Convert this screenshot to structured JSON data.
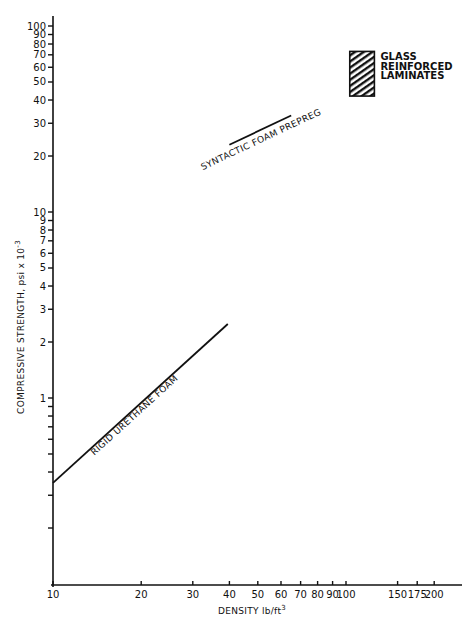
{
  "chart_data": {
    "type": "line",
    "title": "",
    "xlabel": "DENSITY lb/ft",
    "xlabel_superscript": "3",
    "ylabel": "COMPRESSIVE STRENGTH, psi x 10",
    "ylabel_superscript": "-3",
    "xscale": "log",
    "yscale": "log",
    "xlim": [
      10,
      260
    ],
    "ylim": [
      0.1,
      110
    ],
    "grid": false,
    "x_ticks": [
      {
        "value": 10,
        "label": "10"
      },
      {
        "value": 20,
        "label": "20"
      },
      {
        "value": 30,
        "label": "30"
      },
      {
        "value": 40,
        "label": "40"
      },
      {
        "value": 50,
        "label": "50"
      },
      {
        "value": 60,
        "label": "60"
      },
      {
        "value": 70,
        "label": "70"
      },
      {
        "value": 80,
        "label": "80"
      },
      {
        "value": 90,
        "label": "90"
      },
      {
        "value": 100,
        "label": "100"
      },
      {
        "value": 150,
        "label": "150"
      },
      {
        "value": 175,
        "label": "175"
      },
      {
        "value": 200,
        "label": "200"
      }
    ],
    "y_ticks": [
      {
        "value": 0.2,
        "label": ""
      },
      {
        "value": 0.3,
        "label": ""
      },
      {
        "value": 0.4,
        "label": ""
      },
      {
        "value": 0.5,
        "label": ""
      },
      {
        "value": 0.6,
        "label": ""
      },
      {
        "value": 0.7,
        "label": ""
      },
      {
        "value": 0.8,
        "label": ""
      },
      {
        "value": 0.9,
        "label": ""
      },
      {
        "value": 1,
        "label": "1"
      },
      {
        "value": 2,
        "label": "2"
      },
      {
        "value": 3,
        "label": "3"
      },
      {
        "value": 4,
        "label": "4"
      },
      {
        "value": 5,
        "label": "5"
      },
      {
        "value": 6,
        "label": "6"
      },
      {
        "value": 7,
        "label": "7"
      },
      {
        "value": 8,
        "label": "8"
      },
      {
        "value": 9,
        "label": "9"
      },
      {
        "value": 10,
        "label": "10"
      },
      {
        "value": 20,
        "label": "20"
      },
      {
        "value": 30,
        "label": "30"
      },
      {
        "value": 40,
        "label": "40"
      },
      {
        "value": 50,
        "label": "50"
      },
      {
        "value": 60,
        "label": "60"
      },
      {
        "value": 70,
        "label": "70"
      },
      {
        "value": 80,
        "label": "80"
      },
      {
        "value": 90,
        "label": "90"
      },
      {
        "value": 100,
        "label": "100"
      }
    ],
    "series": [
      {
        "name": "RIGID URETHANE FOAM",
        "x": [
          10,
          39.5
        ],
        "y": [
          0.35,
          2.5
        ]
      },
      {
        "name": "SYNTACTIC FOAM PREPREG",
        "x": [
          40,
          65
        ],
        "y": [
          23,
          33
        ]
      }
    ],
    "regions": [
      {
        "name": "GLASS REINFORCED LAMINATES",
        "label_lines": [
          "GLASS",
          "REINFORCED",
          "LAMINATES"
        ],
        "x_range": [
          103,
          125
        ],
        "y_range": [
          42,
          73
        ],
        "fill": "hatched"
      }
    ],
    "legend": "none (inline labels)",
    "colors": {
      "ink": "#111111",
      "background": "#ffffff"
    }
  }
}
